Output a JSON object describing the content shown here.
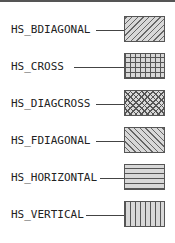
{
  "hatch_styles": [
    {
      "label": "HS_BDIAGONAL",
      "pattern": "bdiagonal"
    },
    {
      "label": "HS_CROSS",
      "pattern": "cross"
    },
    {
      "label": "HS_DIAGCROSS",
      "pattern": "diagcross"
    },
    {
      "label": "HS_FDIAGONAL",
      "pattern": "fdiagonal"
    },
    {
      "label": "HS_HORIZONTAL",
      "pattern": "horizontal"
    },
    {
      "label": "HS_VERTICAL",
      "pattern": "vertical"
    }
  ],
  "colors": {
    "line": "#555555",
    "fill": "#d8d8d8",
    "hatch": "#555555"
  }
}
